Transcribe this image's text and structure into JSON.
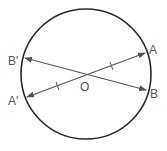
{
  "diagram": {
    "type": "circle-with-diameters",
    "colors": {
      "circle": "#2a2a2a",
      "lines": "#555555",
      "labels": "#555555"
    },
    "circle": {
      "cx": 86,
      "cy": 74,
      "r": 65
    },
    "center_label": "O",
    "points": [
      {
        "id": "A",
        "label": "A",
        "x": 145,
        "y": 53
      },
      {
        "id": "B",
        "label": "B",
        "x": 146,
        "y": 90
      },
      {
        "id": "B_prime",
        "label": "B′",
        "x": 25,
        "y": 58
      },
      {
        "id": "A_prime",
        "label": "A′",
        "x": 27,
        "y": 97
      }
    ],
    "segments": [
      {
        "from": "A_prime",
        "to": "A",
        "arrows": "both",
        "tick_marks": 2
      },
      {
        "from": "B_prime",
        "to": "B",
        "arrows": "both",
        "tick_marks": 0
      }
    ]
  }
}
